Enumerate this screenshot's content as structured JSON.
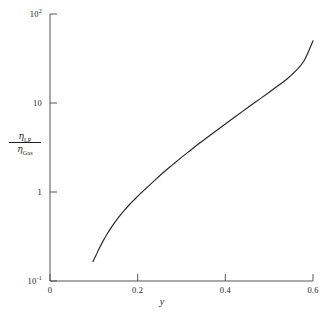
{
  "figure": {
    "background_color": "#ffffff",
    "axis_color": "#555555",
    "curve_color": "#262626"
  },
  "axes": {
    "x_label": "y",
    "y_label": {
      "numerator_symbol": "η",
      "numerator_subscript": "LP",
      "denominator_symbol": "η",
      "denominator_subscript": "Gas",
      "plain": "ηLP / ηGas"
    },
    "x_ticks": [
      {
        "label": "0",
        "value": 0
      },
      {
        "label": "0.2",
        "value": 0.2
      },
      {
        "label": "0.4",
        "value": 0.4
      },
      {
        "label": "0.6",
        "value": 0.6
      }
    ],
    "y_ticks": [
      {
        "label": "10",
        "exponent": "2",
        "value": 100
      },
      {
        "label": "10",
        "exponent": "",
        "value": 10
      },
      {
        "label": "1",
        "exponent": "",
        "value": 1
      },
      {
        "label": "10",
        "exponent": "-1",
        "value": 0.1
      }
    ]
  },
  "caption": "",
  "chart_data": {
    "type": "line",
    "title": "",
    "xlabel": "y",
    "ylabel": "ηLP / ηGas",
    "xscale": "linear",
    "yscale": "log",
    "xlim": [
      0,
      0.6
    ],
    "ylim": [
      0.1,
      100
    ],
    "grid": false,
    "legend": null,
    "series": [
      {
        "name": "ηLP / ηGas vs y",
        "x": [
          0.098,
          0.105,
          0.112,
          0.12,
          0.13,
          0.14,
          0.15,
          0.16,
          0.17,
          0.18,
          0.19,
          0.2,
          0.21,
          0.22,
          0.24,
          0.26,
          0.28,
          0.3,
          0.32,
          0.34,
          0.36,
          0.38,
          0.4,
          0.42,
          0.44,
          0.46,
          0.48,
          0.5,
          0.52,
          0.54,
          0.56,
          0.58,
          0.6
        ],
        "y": [
          0.165,
          0.195,
          0.23,
          0.275,
          0.335,
          0.4,
          0.47,
          0.545,
          0.625,
          0.71,
          0.8,
          0.895,
          1.0,
          1.11,
          1.37,
          1.68,
          2.03,
          2.45,
          2.93,
          3.5,
          4.15,
          4.92,
          5.82,
          6.88,
          8.1,
          9.55,
          11.2,
          13.2,
          15.6,
          18.5,
          22.8,
          30.0,
          50.0
        ]
      }
    ]
  }
}
